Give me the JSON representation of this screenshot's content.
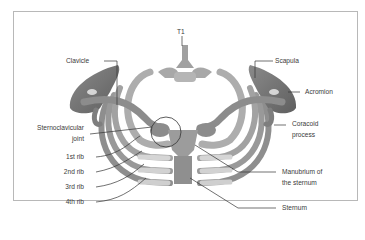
{
  "figure": {
    "labels": {
      "t1": "T1",
      "clavicle": "Clavicle",
      "scapula": "Scapula",
      "acromion": "Acromion",
      "sternoclavicular_line1": "Sternoclavicular",
      "sternoclavicular_line2": "joint",
      "coracoid_line1": "Coracoid",
      "coracoid_line2": "process",
      "rib1": "1st rib",
      "rib2": "2nd rib",
      "rib3": "3rd rib",
      "rib4": "4th rib",
      "manubrium_line1": "Manubrium of",
      "manubrium_line2": "the sternum",
      "sternum": "Sternum"
    },
    "colors": {
      "bone": "#9a9a9a",
      "bone_dark": "#6e6e6e",
      "bone_light": "#bdbdbd",
      "cartilage": "#c9c9c9",
      "leader": "#333333",
      "frame": "#b8b8b8"
    }
  }
}
